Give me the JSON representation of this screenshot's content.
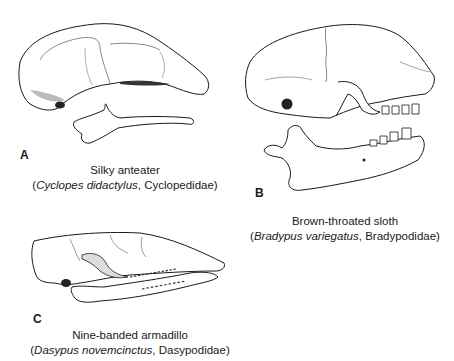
{
  "figure": {
    "panels": [
      {
        "letter": "A",
        "common_name": "Silky anteater",
        "scientific_name": "Cyclopes didactylus",
        "family": "Cyclopedidae",
        "separator": ", ",
        "open_paren": "(",
        "close_paren": ")"
      },
      {
        "letter": "B",
        "common_name": "Brown-throated sloth",
        "scientific_name": "Bradypus variegatus",
        "family": "Bradypodidae",
        "separator": ", ",
        "open_paren": "(",
        "close_paren": ")"
      },
      {
        "letter": "C",
        "common_name": "Nine-banded armadillo",
        "scientific_name": "Dasypus novemcinctus",
        "family": "Dasypodidae",
        "separator": ", ",
        "open_paren": "(",
        "close_paren": ")"
      }
    ],
    "colors": {
      "ink": "#1a1a1a",
      "stipple": "#8a8a8a",
      "background": "#ffffff"
    }
  }
}
